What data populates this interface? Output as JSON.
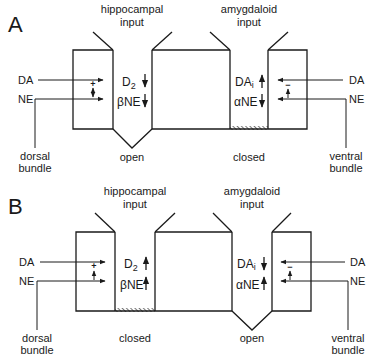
{
  "panels": [
    {
      "label": "A",
      "hippocampal_input": [
        "hippocampal",
        "input"
      ],
      "amygdaloid_input": [
        "amygdaloid",
        "input"
      ],
      "left_inputs": {
        "top": "DA",
        "bottom": "NE",
        "bundle": [
          "dorsal",
          "bundle"
        ],
        "sign": "+",
        "interaction_arrow": "double"
      },
      "right_inputs": {
        "top": "DA",
        "bottom": "NE",
        "bundle": [
          "ventral",
          "bundle"
        ],
        "sign": "−",
        "interaction_arrow": "up"
      },
      "hippocampal_receptors": [
        {
          "name": "D",
          "sub": "2",
          "direction": "down"
        },
        {
          "name": "βNE",
          "sub": "",
          "direction": "down"
        }
      ],
      "amygdaloid_receptors": [
        {
          "name": "DA",
          "sub": "i",
          "direction": "up"
        },
        {
          "name": "αNE",
          "sub": "",
          "direction": "down"
        }
      ],
      "hippocampal_gate": "open",
      "amygdaloid_gate": "closed"
    },
    {
      "label": "B",
      "hippocampal_input": [
        "hippocampal",
        "input"
      ],
      "amygdaloid_input": [
        "amygdaloid",
        "input"
      ],
      "left_inputs": {
        "top": "DA",
        "bottom": "NE",
        "bundle": [
          "dorsal",
          "bundle"
        ],
        "sign": "+",
        "interaction_arrow": "up"
      },
      "right_inputs": {
        "top": "DA",
        "bottom": "NE",
        "bundle": [
          "ventral",
          "bundle"
        ],
        "sign": "−",
        "interaction_arrow": "up"
      },
      "hippocampal_receptors": [
        {
          "name": "D",
          "sub": "2",
          "direction": "up"
        },
        {
          "name": "βNE",
          "sub": "",
          "direction": "up"
        }
      ],
      "amygdaloid_receptors": [
        {
          "name": "DA",
          "sub": "i",
          "direction": "down"
        },
        {
          "name": "αNE",
          "sub": "",
          "direction": "up"
        }
      ],
      "hippocampal_gate": "closed",
      "amygdaloid_gate": "open"
    }
  ],
  "colors": {
    "ink": "#1a1a1a",
    "background": "#ffffff"
  }
}
